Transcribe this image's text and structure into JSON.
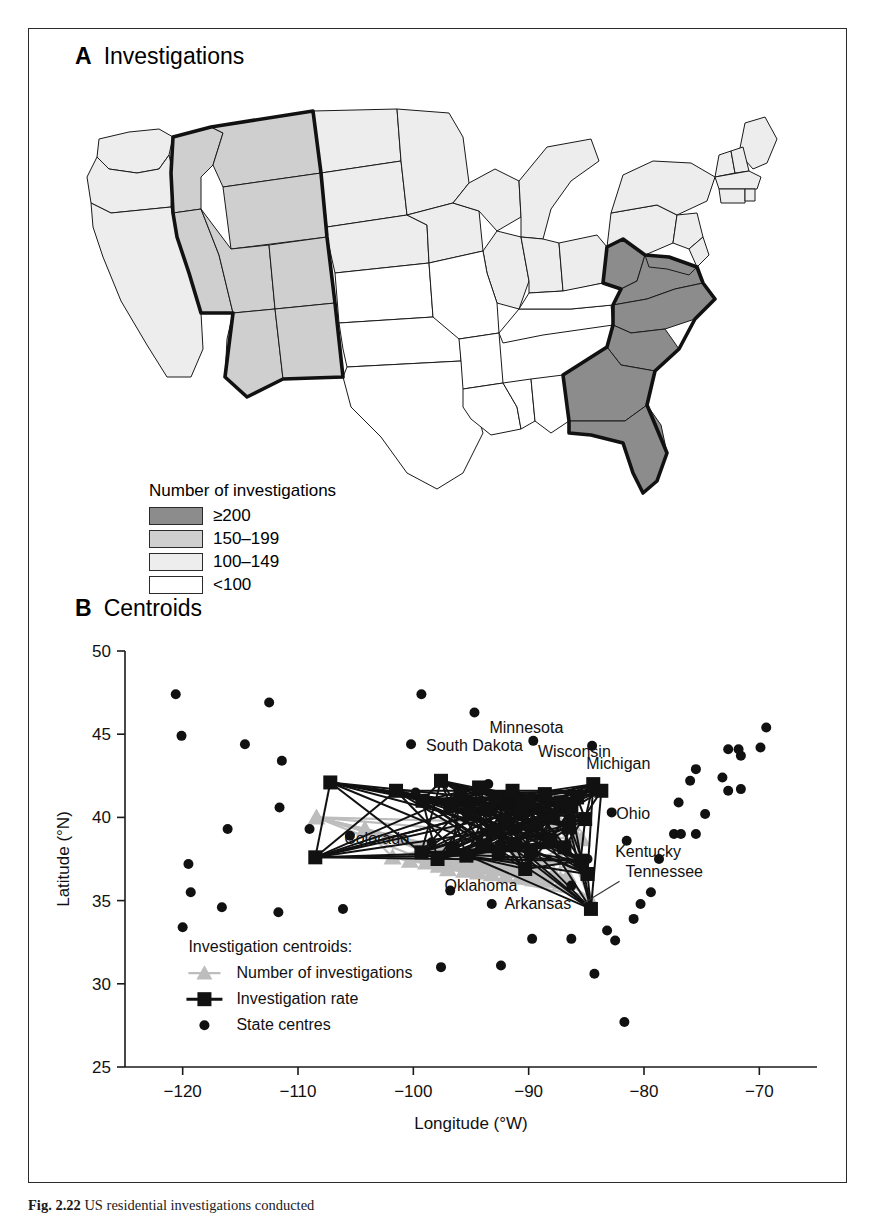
{
  "figure": {
    "caption_label": "Fig. 2.22",
    "caption_text": "US residential investigations conducted"
  },
  "panelA": {
    "letter": "A",
    "title": "Investigations",
    "legend": {
      "title": "Number of investigations",
      "items": [
        {
          "label": "≥200",
          "color": "#8c8c8c"
        },
        {
          "label": "150–199",
          "color": "#cfcfcf"
        },
        {
          "label": "100–149",
          "color": "#ededed"
        },
        {
          "label": "<100",
          "color": "#ffffff"
        }
      ]
    },
    "map_data": {
      "type": "choropleth",
      "classes": [
        "≥200",
        "150–199",
        "100–149",
        "<100"
      ],
      "states_by_class": {
        "≥200": [
          "Virginia",
          "North Carolina",
          "South Carolina",
          "Georgia",
          "Florida",
          "West Virginia",
          "Maryland"
        ],
        "150–199": [
          "Idaho",
          "Montana",
          "Wyoming",
          "Nevada",
          "Utah",
          "Colorado",
          "Arizona",
          "New Mexico"
        ],
        "100–149": [
          "Washington",
          "Oregon",
          "California",
          "North Dakota",
          "South Dakota",
          "Nebraska",
          "Minnesota",
          "Iowa",
          "Wisconsin",
          "Michigan",
          "Illinois",
          "Indiana",
          "Ohio",
          "Pennsylvania",
          "New York",
          "Maine",
          "Vermont",
          "New Hampshire",
          "Massachusetts",
          "Connecticut",
          "Rhode Island",
          "New Jersey",
          "Delaware"
        ],
        "<100": [
          "Texas",
          "Oklahoma",
          "Kansas",
          "Missouri",
          "Arkansas",
          "Louisiana",
          "Mississippi",
          "Alabama",
          "Tennessee",
          "Kentucky"
        ]
      }
    }
  },
  "panelB": {
    "letter": "B",
    "title": "Centroids",
    "chart_data": {
      "type": "scatter",
      "title": "Centroids",
      "xlabel": "Longitude (°W)",
      "ylabel": "Latitude (°N)",
      "xlim": [
        -125,
        -65
      ],
      "ylim": [
        25,
        50
      ],
      "xticks": [
        -120,
        -110,
        -100,
        -90,
        -80,
        -70
      ],
      "yticks": [
        25,
        30,
        35,
        40,
        45,
        50
      ],
      "grid": false,
      "legend_position": "lower-left",
      "legend_title": "Investigation centroids:",
      "series": [
        {
          "name": "Number of investigations",
          "marker": "triangle",
          "color": "#bdbdbd",
          "points": [
            [
              -108.4,
              40.0
            ],
            [
              -104.2,
              39.3
            ],
            [
              -101.8,
              37.6
            ],
            [
              -100.3,
              37.4
            ],
            [
              -98.9,
              37.3
            ],
            [
              -97.8,
              37.1
            ],
            [
              -97.0,
              36.9
            ],
            [
              -96.2,
              37.2
            ],
            [
              -95.6,
              36.8
            ],
            [
              -95.0,
              37.0
            ],
            [
              -94.4,
              36.7
            ],
            [
              -93.8,
              37.1
            ],
            [
              -93.2,
              36.6
            ],
            [
              -92.6,
              37.0
            ],
            [
              -92.0,
              36.5
            ],
            [
              -91.4,
              36.9
            ],
            [
              -90.8,
              36.4
            ],
            [
              -90.2,
              36.8
            ],
            [
              -89.6,
              36.3
            ],
            [
              -89.0,
              36.7
            ],
            [
              -88.4,
              36.2
            ],
            [
              -87.8,
              36.6
            ],
            [
              -87.2,
              36.1
            ],
            [
              -86.6,
              36.5
            ],
            [
              -86.0,
              37.3
            ],
            [
              -85.4,
              38.7
            ],
            [
              -86.2,
              39.6
            ],
            [
              -84.8,
              35.2
            ],
            [
              -87.5,
              39.9
            ],
            [
              -88.2,
              40.1
            ],
            [
              -89.4,
              39.5
            ],
            [
              -90.6,
              38.9
            ]
          ]
        },
        {
          "name": "Investigation rate",
          "marker": "square",
          "color": "#111111",
          "connected": true,
          "points": [
            [
              -107.2,
              42.1
            ],
            [
              -108.5,
              37.6
            ],
            [
              -101.5,
              41.6
            ],
            [
              -99.2,
              41.0
            ],
            [
              -97.6,
              42.2
            ],
            [
              -96.8,
              40.7
            ],
            [
              -95.9,
              41.4
            ],
            [
              -95.1,
              40.2
            ],
            [
              -94.3,
              41.8
            ],
            [
              -93.6,
              40.5
            ],
            [
              -92.9,
              41.2
            ],
            [
              -92.1,
              39.8
            ],
            [
              -91.4,
              41.6
            ],
            [
              -90.7,
              40.3
            ],
            [
              -90.0,
              41.0
            ],
            [
              -89.3,
              39.6
            ],
            [
              -88.6,
              41.4
            ],
            [
              -87.9,
              40.1
            ],
            [
              -87.2,
              40.9
            ],
            [
              -86.5,
              39.4
            ],
            [
              -85.8,
              41.2
            ],
            [
              -85.1,
              39.9
            ],
            [
              -84.4,
              42.0
            ],
            [
              -83.7,
              41.6
            ],
            [
              -86.9,
              38.2
            ],
            [
              -88.1,
              38.6
            ],
            [
              -89.8,
              38.0
            ],
            [
              -91.2,
              38.4
            ],
            [
              -92.6,
              37.9
            ],
            [
              -94.0,
              38.3
            ],
            [
              -95.4,
              37.7
            ],
            [
              -96.6,
              38.1
            ],
            [
              -97.9,
              37.5
            ],
            [
              -99.3,
              37.9
            ],
            [
              -85.5,
              37.4
            ],
            [
              -84.9,
              36.6
            ],
            [
              -84.6,
              34.5
            ],
            [
              -86.3,
              40.6
            ],
            [
              -93.0,
              39.2
            ],
            [
              -90.3,
              36.9
            ]
          ]
        },
        {
          "name": "State centres",
          "marker": "circle",
          "color": "#111111",
          "points": [
            [
              -120.6,
              47.4
            ],
            [
              -120.1,
              44.9
            ],
            [
              -114.6,
              44.4
            ],
            [
              -112.5,
              46.9
            ],
            [
              -111.6,
              40.6
            ],
            [
              -116.1,
              39.3
            ],
            [
              -119.5,
              37.2
            ],
            [
              -116.6,
              34.6
            ],
            [
              -111.7,
              34.3
            ],
            [
              -105.5,
              38.9
            ],
            [
              -106.1,
              34.5
            ],
            [
              -109.0,
              39.3
            ],
            [
              -111.4,
              43.4
            ],
            [
              -119.3,
              35.5
            ],
            [
              -120.0,
              33.4
            ],
            [
              -99.3,
              47.4
            ],
            [
              -100.2,
              44.4
            ],
            [
              -99.8,
              41.5
            ],
            [
              -98.4,
              38.5
            ],
            [
              -97.6,
              31.0
            ],
            [
              -94.7,
              46.3
            ],
            [
              -93.5,
              42.0
            ],
            [
              -92.5,
              38.4
            ],
            [
              -93.2,
              34.8
            ],
            [
              -92.4,
              31.1
            ],
            [
              -96.8,
              35.6
            ],
            [
              -89.6,
              44.6
            ],
            [
              -88.9,
              40.0
            ],
            [
              -86.3,
              39.9
            ],
            [
              -86.3,
              32.7
            ],
            [
              -89.7,
              32.7
            ],
            [
              -86.3,
              35.9
            ],
            [
              -84.9,
              37.5
            ],
            [
              -84.5,
              44.3
            ],
            [
              -82.8,
              40.3
            ],
            [
              -81.5,
              38.6
            ],
            [
              -82.5,
              32.6
            ],
            [
              -81.7,
              27.7
            ],
            [
              -80.9,
              33.9
            ],
            [
              -79.4,
              35.5
            ],
            [
              -78.7,
              37.5
            ],
            [
              -77.4,
              39.0
            ],
            [
              -76.8,
              39.0
            ],
            [
              -77.0,
              40.9
            ],
            [
              -75.5,
              39.0
            ],
            [
              -74.7,
              40.2
            ],
            [
              -75.5,
              42.9
            ],
            [
              -72.7,
              41.6
            ],
            [
              -71.6,
              41.7
            ],
            [
              -71.6,
              43.7
            ],
            [
              -71.8,
              44.1
            ],
            [
              -69.4,
              45.4
            ],
            [
              -72.7,
              44.1
            ],
            [
              -76.0,
              42.2
            ],
            [
              -69.9,
              44.2
            ],
            [
              -73.2,
              42.4
            ],
            [
              -83.2,
              33.2
            ],
            [
              -84.3,
              30.6
            ],
            [
              -80.3,
              34.8
            ]
          ]
        }
      ],
      "annotations": [
        {
          "text": "Minnesota",
          "x": -93.4,
          "y": 45.1,
          "leader": false
        },
        {
          "text": "South Dakota",
          "x": -98.9,
          "y": 44.0,
          "leader": false
        },
        {
          "text": "Wisconsin",
          "x": -89.2,
          "y": 43.6,
          "leader": false
        },
        {
          "text": "Michigan",
          "x": -85.0,
          "y": 42.9,
          "leader": false
        },
        {
          "text": "Colorado",
          "x": -106.0,
          "y": 38.4,
          "leader": false
        },
        {
          "text": "Ohio",
          "x": -82.4,
          "y": 39.9,
          "leader": false
        },
        {
          "text": "Kentucky",
          "x": -82.5,
          "y": 37.6,
          "leader": false
        },
        {
          "text": "Tennessee",
          "x": -81.6,
          "y": 36.4,
          "leader": true
        },
        {
          "text": "Oklahoma",
          "x": -97.3,
          "y": 35.6,
          "leader": false
        },
        {
          "text": "Arkansas",
          "x": -92.1,
          "y": 34.5,
          "leader": false
        }
      ]
    }
  }
}
